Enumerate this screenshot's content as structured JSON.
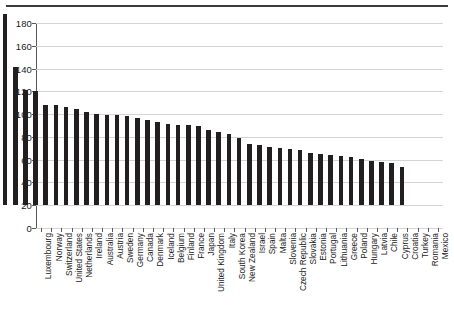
{
  "chart_data": {
    "type": "bar",
    "title": "",
    "subtitle": "",
    "xlabel": "",
    "ylabel": "",
    "ylim": [
      0,
      180
    ],
    "yticks": [
      0,
      20,
      40,
      60,
      80,
      100,
      120,
      140,
      160,
      180
    ],
    "grid": true,
    "legend": null,
    "bar_color": "#231f20",
    "categories": [
      "Luxembourg",
      "Norway",
      "Switzerland",
      "United States",
      "Netherlands",
      "Ireland",
      "Australia",
      "Austria",
      "Sweden",
      "Germany",
      "Canada",
      "Denmark",
      "Iceland",
      "Belgium",
      "Finland",
      "France",
      "Japan",
      "United Kingdom",
      "Italy",
      "South Korea",
      "New Zealand",
      "Israel",
      "Spain",
      "Malta",
      "Slovenia",
      "Czech Republic",
      "Slovakia",
      "Estonia",
      "Portugal",
      "Lithuania",
      "Greece",
      "Poland",
      "Hungary",
      "Latvia",
      "Chile",
      "Cyprus",
      "Croatia",
      "Turkey",
      "Romania",
      "Mexico"
    ],
    "values": [
      168,
      121,
      101,
      100,
      88,
      88,
      86,
      84,
      82,
      80,
      79,
      79,
      78,
      76,
      75,
      73,
      71,
      70,
      70,
      69,
      66,
      64,
      62,
      59,
      54,
      53,
      51,
      50,
      49,
      48,
      46,
      45,
      44,
      43,
      42,
      40,
      39,
      38,
      37,
      33
    ]
  }
}
